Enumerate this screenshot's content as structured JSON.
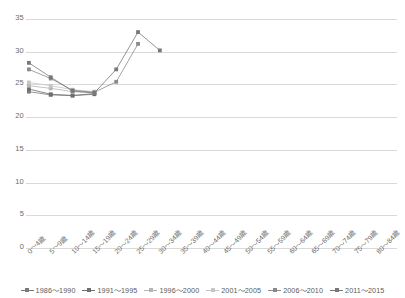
{
  "chart_data": {
    "type": "line",
    "title": "",
    "subtitle": "",
    "xlabel": "",
    "ylabel": "",
    "ylim": [
      0,
      35
    ],
    "yticks": [
      0,
      5,
      10,
      15,
      20,
      25,
      30,
      35
    ],
    "ytick_labels": [
      "0",
      "5",
      "10",
      "15",
      "20",
      "25",
      "30",
      "35"
    ],
    "grid": true,
    "legend_position": "bottom",
    "categories": [
      "0～4歳",
      "5～9歳",
      "10～14歳",
      "15～19歳",
      "20～24歳",
      "25～29歳",
      "30～34歳",
      "35～39歳",
      "40～44歳",
      "45～49歳",
      "50～54歳",
      "55～59歳",
      "60～64歳",
      "65～69歳",
      "70～74歳",
      "75～79歳",
      "80～84歳"
    ],
    "series": [
      {
        "name": "1986～1990",
        "color": "#7a7a7a",
        "values": [
          23.9,
          23.4,
          23.3,
          23.6,
          null,
          null,
          null,
          null,
          null,
          null,
          null,
          null,
          null,
          null,
          null,
          null,
          null
        ]
      },
      {
        "name": "1991～1995",
        "color": "#6e6e6e",
        "values": [
          24.3,
          23.5,
          23.3,
          23.5,
          null,
          null,
          null,
          null,
          null,
          null,
          null,
          null,
          null,
          null,
          null,
          null,
          null
        ]
      },
      {
        "name": "1996～2000",
        "color": "#b5b5b5",
        "values": [
          24.8,
          24.4,
          23.9,
          23.7,
          null,
          null,
          null,
          null,
          null,
          null,
          null,
          null,
          null,
          null,
          null,
          null,
          null
        ]
      },
      {
        "name": "2001～2005",
        "color": "#c6c6c6",
        "values": [
          25.3,
          24.8,
          24.2,
          23.9,
          null,
          null,
          null,
          null,
          null,
          null,
          null,
          null,
          null,
          null,
          null,
          null,
          null
        ]
      },
      {
        "name": "2006～2010",
        "color": "#8a8a8a",
        "values": [
          27.3,
          25.9,
          24.1,
          23.8,
          25.4,
          31.2,
          null,
          null,
          null,
          null,
          null,
          null,
          null,
          null,
          null,
          null,
          null
        ]
      },
      {
        "name": "2011～2015",
        "color": "#787878",
        "values": [
          28.3,
          26.1,
          24.0,
          23.7,
          27.3,
          33.0,
          30.2,
          null,
          null,
          null,
          null,
          null,
          null,
          null,
          null,
          null,
          null
        ]
      }
    ]
  }
}
